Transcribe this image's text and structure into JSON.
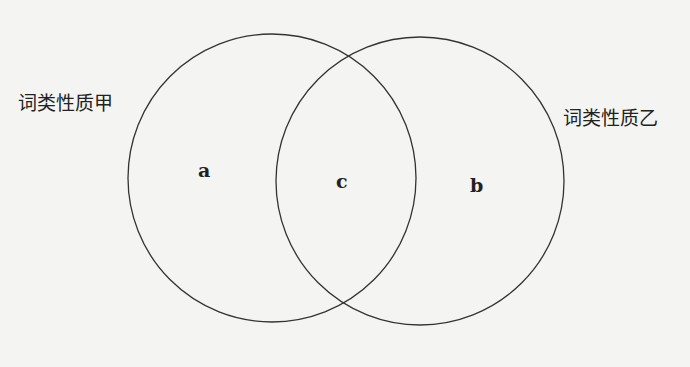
{
  "diagram": {
    "type": "venn",
    "sets": [
      {
        "id": "left",
        "label": "词类性质甲"
      },
      {
        "id": "right",
        "label": "词类性质乙"
      }
    ],
    "regions": [
      {
        "id": "a",
        "label": "a",
        "description": "only 词类性质甲"
      },
      {
        "id": "c",
        "label": "c",
        "description": "intersection"
      },
      {
        "id": "b",
        "label": "b",
        "description": "only 词类性质乙"
      }
    ]
  }
}
